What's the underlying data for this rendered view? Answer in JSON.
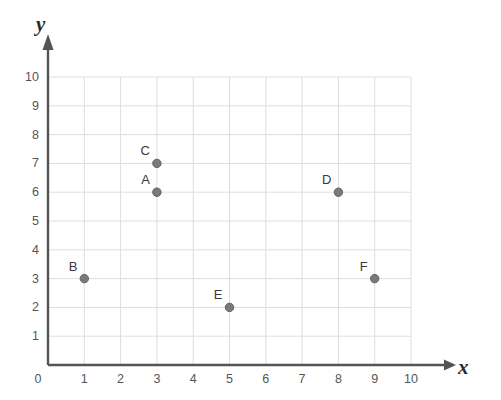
{
  "chart_data": {
    "type": "scatter",
    "title": "",
    "xlabel": "x",
    "ylabel": "y",
    "xlim": [
      0,
      10
    ],
    "ylim": [
      0,
      10
    ],
    "grid": true,
    "legend": "none",
    "x_ticks": [
      "0",
      "1",
      "2",
      "3",
      "4",
      "5",
      "6",
      "7",
      "8",
      "9",
      "10"
    ],
    "y_ticks": [
      "0",
      "1",
      "2",
      "3",
      "4",
      "5",
      "6",
      "7",
      "8",
      "9",
      "10"
    ],
    "points": [
      {
        "label": "A",
        "x": 3,
        "y": 6
      },
      {
        "label": "B",
        "x": 1,
        "y": 3
      },
      {
        "label": "C",
        "x": 3,
        "y": 7
      },
      {
        "label": "D",
        "x": 8,
        "y": 6
      },
      {
        "label": "E",
        "x": 5,
        "y": 2
      },
      {
        "label": "F",
        "x": 9,
        "y": 3
      }
    ]
  },
  "style": {
    "marker_color": "#7a7a7a",
    "marker_edge_color": "#5f5f5f",
    "grid_color": "#dedede",
    "axis_color": "#545454",
    "tick_text_color": "#555555",
    "label_text_color": "#3a3a3a",
    "background": "#ffffff"
  },
  "geometry": {
    "origin_x": 48,
    "origin_y": 365,
    "unit_x": 36.3,
    "unit_y": 28.8,
    "marker_radius": 4.2
  }
}
